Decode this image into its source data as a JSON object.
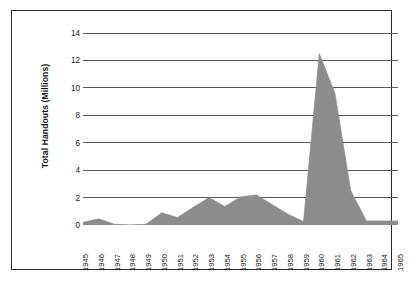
{
  "chart_data": {
    "type": "area",
    "title": "",
    "xlabel": "",
    "ylabel": "Total Handouts (Millions)",
    "categories": [
      "1945",
      "1946",
      "1947",
      "1948",
      "1949",
      "1950",
      "1951",
      "1952",
      "1953",
      "1954",
      "1955",
      "1956",
      "1957",
      "1958",
      "1959",
      "1960",
      "1961",
      "1962",
      "1963",
      "1964",
      "1965"
    ],
    "values": [
      0.2,
      0.45,
      0.05,
      0.0,
      0.05,
      0.9,
      0.55,
      1.3,
      2.0,
      1.35,
      2.05,
      2.2,
      1.5,
      0.8,
      0.25,
      12.5,
      9.6,
      2.5,
      0.3,
      0.3,
      0.3
    ],
    "series": [
      {
        "name": "Total Handouts",
        "values": [
          0.2,
          0.45,
          0.05,
          0.0,
          0.05,
          0.9,
          0.55,
          1.3,
          2.0,
          1.35,
          2.05,
          2.2,
          1.5,
          0.8,
          0.25,
          12.5,
          9.6,
          2.5,
          0.3,
          0.3,
          0.3
        ]
      }
    ],
    "ylim": [
      0,
      14
    ],
    "yticks": [
      0,
      2,
      4,
      6,
      8,
      10,
      12,
      14
    ],
    "ytick_labels": [
      "0",
      "2",
      "4",
      "6",
      "8",
      "10",
      "12",
      "14"
    ],
    "xlim": [
      "1945",
      "1965"
    ],
    "grid": "horizontal",
    "legend": "none",
    "area_fill_color": "#8c8c8c",
    "gridline_color": "#595959",
    "axis_color": "#2b2b2b",
    "text_color": "#161616",
    "background_color": "#ffffff",
    "border_color": "#2b2b2b"
  }
}
